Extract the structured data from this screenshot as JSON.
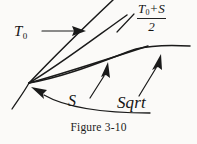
{
  "figure": {
    "caption": "Figure 3-10",
    "background_color": "#fbfaf8",
    "ink_color": "#1a1a1a",
    "labels": {
      "t0": {
        "base": "T",
        "subscript": "0",
        "full_text": "T0"
      },
      "average": {
        "numerator_base": "T",
        "numerator_subscript": "0",
        "numerator_operator": "+",
        "numerator_second": "S",
        "denominator": "2",
        "full_text": "(T0 + S) / 2"
      },
      "s": "S",
      "sqrt": "Sqrt"
    }
  }
}
